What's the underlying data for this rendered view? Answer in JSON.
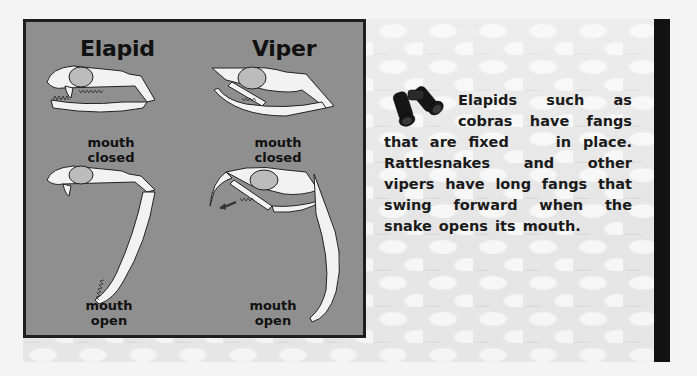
{
  "figure": {
    "left_panel": {
      "columns": [
        {
          "title": "Elapid",
          "closed_caption": "mouth closed",
          "open_caption_line1": "mouth",
          "open_caption_line2": "open"
        },
        {
          "title": "Viper",
          "closed_caption": "mouth closed",
          "open_caption_line1": "mouth",
          "open_caption_line2": "open"
        }
      ],
      "background_color": "#8f8f8f",
      "border_color": "#1e1e1e"
    },
    "note": {
      "icon": "binoculars-icon",
      "text_part1": "Elapids such as cobras have fangs that are fixed",
      "text_part2": "in place. Rattlesnakes and other vipers have long fangs that swing forward when the snake opens its mouth."
    },
    "side_bar_color": "#121212"
  }
}
